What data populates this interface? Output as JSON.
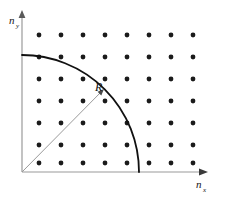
{
  "figure": {
    "background_color": "#ffffff"
  },
  "axes": {
    "origin": {
      "x": 22,
      "y": 172
    },
    "color": "#9a9a9a",
    "x_axis": {
      "label_base": "n",
      "label_sub": "x",
      "label_x": 198,
      "label_y": 186,
      "start_x": 22,
      "end_x": 207,
      "y": 172,
      "arrow": "arrowhead-right"
    },
    "y_axis": {
      "label_base": "n",
      "label_sub": "y",
      "label_x": 9,
      "label_y": 24,
      "x": 22,
      "start_y": 172,
      "end_y": 11,
      "arrow": "arrowhead-up"
    }
  },
  "arc": {
    "center_x": 22,
    "center_y": 172,
    "radius": 117,
    "color": "#111111",
    "stroke_width": 1.8,
    "y_intercept": {
      "x": 22,
      "y": 55
    },
    "x_intercept": {
      "x": 139,
      "y": 172
    }
  },
  "radius_line": {
    "from_x": 22,
    "from_y": 172,
    "to_x": 104,
    "to_y": 89,
    "color": "#9a9a9a",
    "stroke_width": 1.0,
    "arrow": "arrowhead-radius",
    "label": "R",
    "label_x": 95,
    "label_y": 91
  },
  "lattice": {
    "dot_color": "#1b1b1b",
    "dot_radius": 2.4,
    "start_x": 39,
    "start_y": 35,
    "spacing_x": 22,
    "spacing_y": 22,
    "columns": 8,
    "rows": 7,
    "points": [
      {
        "x": 39,
        "y": 35
      },
      {
        "x": 61,
        "y": 35
      },
      {
        "x": 83,
        "y": 35
      },
      {
        "x": 105,
        "y": 35
      },
      {
        "x": 127,
        "y": 35
      },
      {
        "x": 149,
        "y": 35
      },
      {
        "x": 171,
        "y": 35
      },
      {
        "x": 193,
        "y": 35
      },
      {
        "x": 39,
        "y": 57
      },
      {
        "x": 61,
        "y": 57
      },
      {
        "x": 83,
        "y": 57
      },
      {
        "x": 105,
        "y": 57
      },
      {
        "x": 127,
        "y": 57
      },
      {
        "x": 149,
        "y": 57
      },
      {
        "x": 171,
        "y": 57
      },
      {
        "x": 193,
        "y": 57
      },
      {
        "x": 39,
        "y": 79
      },
      {
        "x": 61,
        "y": 79
      },
      {
        "x": 83,
        "y": 79
      },
      {
        "x": 105,
        "y": 79
      },
      {
        "x": 127,
        "y": 79
      },
      {
        "x": 149,
        "y": 79
      },
      {
        "x": 171,
        "y": 79
      },
      {
        "x": 193,
        "y": 79
      },
      {
        "x": 39,
        "y": 101
      },
      {
        "x": 61,
        "y": 101
      },
      {
        "x": 83,
        "y": 101
      },
      {
        "x": 105,
        "y": 101
      },
      {
        "x": 127,
        "y": 101
      },
      {
        "x": 149,
        "y": 101
      },
      {
        "x": 171,
        "y": 101
      },
      {
        "x": 193,
        "y": 101
      },
      {
        "x": 39,
        "y": 123
      },
      {
        "x": 61,
        "y": 123
      },
      {
        "x": 83,
        "y": 123
      },
      {
        "x": 105,
        "y": 123
      },
      {
        "x": 127,
        "y": 123
      },
      {
        "x": 149,
        "y": 123
      },
      {
        "x": 171,
        "y": 123
      },
      {
        "x": 193,
        "y": 123
      },
      {
        "x": 39,
        "y": 145
      },
      {
        "x": 61,
        "y": 145
      },
      {
        "x": 83,
        "y": 145
      },
      {
        "x": 105,
        "y": 145
      },
      {
        "x": 127,
        "y": 145
      },
      {
        "x": 149,
        "y": 145
      },
      {
        "x": 171,
        "y": 145
      },
      {
        "x": 193,
        "y": 145
      },
      {
        "x": 39,
        "y": 163
      },
      {
        "x": 61,
        "y": 163
      },
      {
        "x": 83,
        "y": 163
      },
      {
        "x": 105,
        "y": 163
      },
      {
        "x": 127,
        "y": 163
      },
      {
        "x": 149,
        "y": 163
      },
      {
        "x": 171,
        "y": 163
      },
      {
        "x": 193,
        "y": 163
      }
    ]
  }
}
